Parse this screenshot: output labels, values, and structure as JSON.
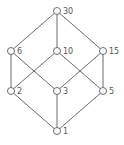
{
  "diagram": {
    "colors": {
      "line": "#6a6a6a",
      "node_fill": "#ffffff",
      "label": "#555555"
    },
    "nodes": [
      {
        "id": "30",
        "label": "30",
        "x": 57,
        "y": 11
      },
      {
        "id": "6",
        "label": "6",
        "x": 11,
        "y": 51
      },
      {
        "id": "10",
        "label": "10",
        "x": 57,
        "y": 51
      },
      {
        "id": "15",
        "label": "15",
        "x": 103,
        "y": 51
      },
      {
        "id": "2",
        "label": "2",
        "x": 11,
        "y": 91
      },
      {
        "id": "3",
        "label": "3",
        "x": 57,
        "y": 91
      },
      {
        "id": "5",
        "label": "5",
        "x": 103,
        "y": 91
      },
      {
        "id": "1",
        "label": "1",
        "x": 57,
        "y": 131
      }
    ],
    "edges": [
      [
        "30",
        "6"
      ],
      [
        "30",
        "10"
      ],
      [
        "30",
        "15"
      ],
      [
        "6",
        "2"
      ],
      [
        "6",
        "3"
      ],
      [
        "10",
        "2"
      ],
      [
        "10",
        "5"
      ],
      [
        "15",
        "3"
      ],
      [
        "15",
        "5"
      ],
      [
        "2",
        "1"
      ],
      [
        "3",
        "1"
      ],
      [
        "5",
        "1"
      ]
    ]
  }
}
